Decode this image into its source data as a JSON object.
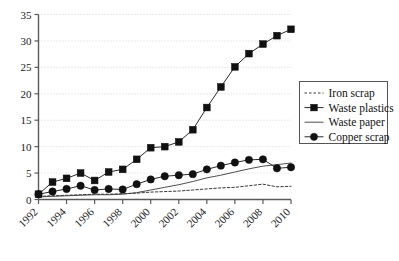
{
  "chart_data": {
    "type": "line",
    "title": "",
    "xlabel": "",
    "ylabel": "",
    "xlim": [
      1992,
      2010
    ],
    "ylim": [
      0,
      35
    ],
    "grid": true,
    "legend_position": "right",
    "x": [
      1992,
      1993,
      1994,
      1995,
      1996,
      1997,
      1998,
      1999,
      2000,
      2001,
      2002,
      2003,
      2004,
      2005,
      2006,
      2007,
      2008,
      2009,
      2010
    ],
    "xticks": [
      1992,
      1994,
      1996,
      1998,
      2000,
      2002,
      2004,
      2006,
      2008,
      2010
    ],
    "xtick_labels": [
      "1992",
      "1994",
      "1996",
      "1998",
      "2000",
      "2002",
      "2004",
      "2006",
      "2008",
      "2010"
    ],
    "yticks": [
      0,
      5,
      10,
      15,
      20,
      25,
      30,
      35
    ],
    "ytick_labels": [
      "0",
      "5",
      "10",
      "15",
      "20",
      "25",
      "30",
      "35"
    ],
    "series": [
      {
        "name": "Iron scrap",
        "style": "dashed",
        "marker": "none",
        "color": "#3a3a3a",
        "values": [
          0.6,
          0.7,
          0.8,
          0.9,
          1.0,
          1.0,
          1.1,
          1.2,
          1.4,
          1.5,
          1.6,
          1.8,
          2.0,
          2.2,
          2.3,
          2.6,
          2.9,
          2.4,
          2.5
        ]
      },
      {
        "name": "Waste plastics",
        "style": "solid",
        "marker": "square",
        "color": "#111111",
        "values": [
          1.0,
          3.3,
          4.0,
          5.0,
          3.6,
          5.2,
          5.7,
          7.6,
          9.8,
          10.0,
          10.9,
          13.2,
          17.4,
          21.3,
          25.1,
          27.6,
          29.4,
          31.0,
          32.2
        ]
      },
      {
        "name": "Waste paper",
        "style": "solid",
        "marker": "none",
        "color": "#3a3a3a",
        "values": [
          0.5,
          0.6,
          0.7,
          0.8,
          0.9,
          0.9,
          1.0,
          1.3,
          1.8,
          2.3,
          2.8,
          3.4,
          4.1,
          4.6,
          5.2,
          5.8,
          6.3,
          6.6,
          6.9
        ]
      },
      {
        "name": "Copper scrap",
        "style": "solid",
        "marker": "circle",
        "color": "#111111",
        "values": [
          1.0,
          1.5,
          2.0,
          2.6,
          1.8,
          2.0,
          1.9,
          2.9,
          3.8,
          4.4,
          4.6,
          4.8,
          5.7,
          6.4,
          7.0,
          7.5,
          7.6,
          5.9,
          6.1
        ]
      }
    ]
  },
  "legend": {
    "entries": [
      {
        "label": "Iron scrap"
      },
      {
        "label": "Waste plastics"
      },
      {
        "label": "Waste paper"
      },
      {
        "label": "Copper scrap"
      }
    ]
  }
}
